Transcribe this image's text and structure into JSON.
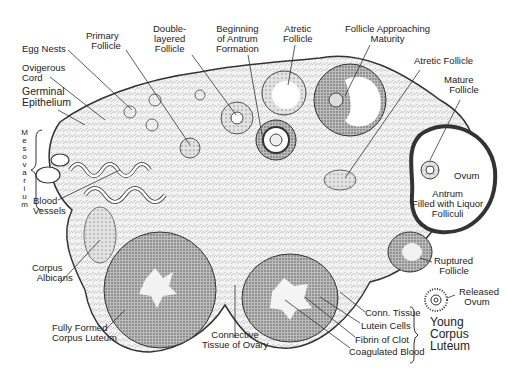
{
  "colors": {
    "ink": "#222222",
    "tissue_fill": "#f1f1f1",
    "dense": "#6a6a6a",
    "background": "#ffffff"
  },
  "labels": {
    "egg_nests": "Egg Nests",
    "primary_follicle": "Primary\n  Follicle",
    "double_layered_follicle": "Double-\nlayered\nFollicle",
    "beginning_antrum": "Beginning\nof Antrum\nFormation",
    "atretic_follicle_top": "Atretic\nFollicle",
    "follicle_approaching_maturity": "Follicle Approaching\nMaturity",
    "atretic_follicle_right": "Atretic Follicle",
    "mature_follicle": "Mature\n  Follicle",
    "ovigerous_cord": "Ovigerous\nCord",
    "germinal_epithelium": "Germinal\nEpithelium",
    "mesovarium": "Mesovarium",
    "ovum": "Ovum",
    "antrum": "Antrum\nFilled with Liquor\nFolliculi",
    "blood_vessels": "Blood\nVessels",
    "corpus_albicans": "Corpus\n  Albicans",
    "ruptured_follicle": "Ruptured\n  Follicle",
    "released_ovum": "Released\n  Ovum",
    "fully_formed_corpus_luteum": "Fully Formed\nCorpus Luteum",
    "connective_tissue_of_ovary": "Connective\nTissue of Ovary",
    "conn_tissue": "Conn. Tissue",
    "lutein_cells": "Lutein Cells",
    "fibrin_of_clot": "Fibrin of Clot",
    "coagulated_blood": "Coagulated Blood",
    "young_corpus_luteum": "Young\nCorpus\nLuteum"
  }
}
